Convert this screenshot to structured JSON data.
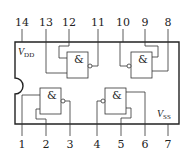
{
  "chip": {
    "supply_top": {
      "symbol": "V",
      "subscript": "DD"
    },
    "supply_bottom": {
      "symbol": "V",
      "subscript": "SS"
    },
    "colors": {
      "line": "#333333",
      "background": "#ffffff"
    }
  },
  "pins_top": [
    {
      "number": "14",
      "x": 22
    },
    {
      "number": "13",
      "x": 46
    },
    {
      "number": "12",
      "x": 69
    },
    {
      "number": "11",
      "x": 98
    },
    {
      "number": "10",
      "x": 123
    },
    {
      "number": "9",
      "x": 145
    },
    {
      "number": "8",
      "x": 168
    }
  ],
  "pins_bottom": [
    {
      "number": "1",
      "x": 22
    },
    {
      "number": "2",
      "x": 46
    },
    {
      "number": "3",
      "x": 70
    },
    {
      "number": "4",
      "x": 97
    },
    {
      "number": "5",
      "x": 121
    },
    {
      "number": "6",
      "x": 145
    },
    {
      "number": "7",
      "x": 168
    }
  ],
  "gates": [
    {
      "label": "&",
      "type": "NAND",
      "inputs": [
        "13",
        "12"
      ],
      "output": "11",
      "output_side": "right"
    },
    {
      "label": "&",
      "type": "NAND",
      "inputs": [
        "9",
        "8"
      ],
      "output": "10",
      "output_side": "left"
    },
    {
      "label": "&",
      "type": "NAND",
      "inputs": [
        "1",
        "2"
      ],
      "output": "3",
      "output_side": "right"
    },
    {
      "label": "&",
      "type": "NAND",
      "inputs": [
        "5",
        "6"
      ],
      "output": "4",
      "output_side": "left"
    }
  ]
}
